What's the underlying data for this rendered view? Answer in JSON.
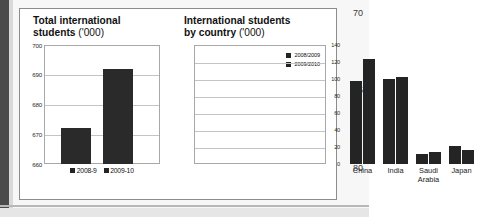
{
  "page": {
    "line_numbers": [
      "70",
      "75",
      "80"
    ]
  },
  "charts": {
    "left": {
      "title_bold": "Total international",
      "title_bold2": "students",
      "title_thin": "('000)",
      "legend": [
        {
          "label": "2008-9",
          "color": "#242424"
        },
        {
          "label": "2009-10",
          "color": "#242424"
        }
      ]
    },
    "right": {
      "title_bold": "International students",
      "title_bold2": "by country",
      "title_thin": "('000)",
      "legend": [
        {
          "label": "2008/2009",
          "color": "#242424"
        },
        {
          "label": "2009/2010",
          "color": "#242424"
        }
      ]
    }
  },
  "chart_data": [
    {
      "type": "bar",
      "title": "Total international students ('000)",
      "categories": [
        "2008-9",
        "2009-10"
      ],
      "values": [
        672,
        692
      ],
      "xlabel": "",
      "ylabel": "",
      "ylim": [
        660,
        700
      ],
      "yticks": [
        660,
        670,
        680,
        690,
        700
      ],
      "ytick_labels": [
        "660",
        "670",
        "680",
        "690",
        "700"
      ],
      "grid": true,
      "legend_position": "bottom",
      "bar_color": "#2a2a2a"
    },
    {
      "type": "bar",
      "title": "International students by country ('000)",
      "categories": [
        "China",
        "India",
        "Saudi Arabia",
        "Japan"
      ],
      "series": [
        {
          "name": "2008/2009",
          "values": [
            98,
            100,
            12,
            21
          ]
        },
        {
          "name": "2009/2010",
          "values": [
            123,
            102,
            14,
            17
          ]
        }
      ],
      "xlabel": "",
      "ylabel": "",
      "ylim": [
        0,
        140
      ],
      "yticks": [
        0,
        20,
        40,
        60,
        80,
        100,
        120,
        140
      ],
      "ytick_labels": [
        "0",
        "20",
        "40",
        "60",
        "80",
        "100",
        "120",
        "140"
      ],
      "grid": true,
      "legend_position": "top-right",
      "bar_color": "#242424"
    }
  ]
}
